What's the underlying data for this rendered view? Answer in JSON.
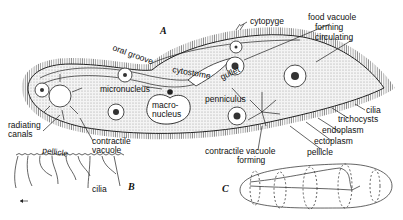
{
  "figure_labels": {
    "a": "A",
    "b": "B",
    "c": "C"
  },
  "labels_a": {
    "oral_groove": "oral groove",
    "cytopyge": "cytopyge",
    "food_vacuole_1": "food vacuole",
    "food_vacuole_2": "forming",
    "food_vacuole_3": "circulating",
    "cytostome": "cytostome",
    "gullet": "gullet",
    "micronucleus": "micronucleus",
    "macronucleus_1": "macro-",
    "macronucleus_2": "nucleus",
    "penniculus": "penniculus",
    "cilia": "cilia",
    "trichocysts": "trichocysts",
    "endoplasm": "endoplasm",
    "ectoplasm": "ectoplasm",
    "pellicle": "pellicle",
    "radiating_canals_1": "radiating",
    "radiating_canals_2": "canals",
    "contractile_vacuole_1": "contractile",
    "contractile_vacuole_2": "vacuole",
    "cv_forming_1": "contractile vacuole",
    "cv_forming_2": "forming"
  },
  "labels_b": {
    "pellicle": "pellicle",
    "cilia": "cilia"
  },
  "colors": {
    "ink": "#111111",
    "stipple": "#d9d9d9",
    "background": "#ffffff"
  }
}
